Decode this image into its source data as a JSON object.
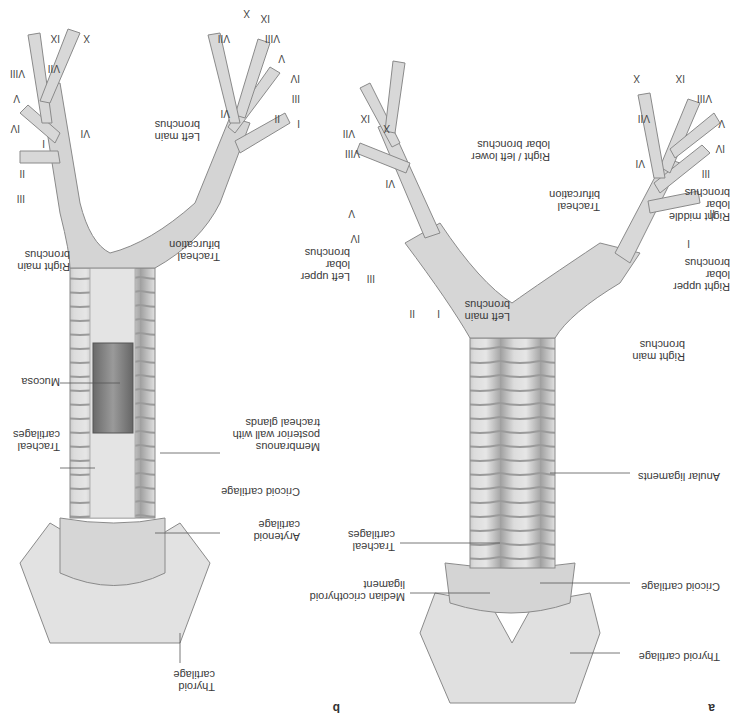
{
  "figure": {
    "orientation": "rotated 180 degrees",
    "panels": [
      {
        "id": "a",
        "letter": "a",
        "view": "anterior",
        "labels": {
          "thyroid_cartilage": "Thyroid cartilage",
          "cricoid_cartilage": "Cricoid cartilage",
          "median_cricothyroid_ligament": "Median cricothyroid ligament",
          "tracheal_cartilages": "Tracheal cartilages",
          "anular_ligaments": "Anular ligaments",
          "right_main_bronchus": "Right main bronchus",
          "left_main_bronchus": "Left main bronchus",
          "tracheal_bifurcation": "Tracheal bifurcation",
          "right_upper_lobar_bronchus": "Right upper lobar bronchus",
          "right_middle_lobar_bronchus": "Right middle lobar bronchus",
          "right_left_lower_lobar_bronchus": "Right / left lower lobar bronchus",
          "left_upper_lobar_bronchus": "Left upper lobar bronchus"
        },
        "segments_right": [
          "I",
          "II",
          "III",
          "IV",
          "V",
          "VI",
          "VII",
          "VIII",
          "IX",
          "X"
        ],
        "segments_left": [
          "I",
          "II",
          "III",
          "IV",
          "V",
          "VI",
          "VII",
          "VIII",
          "IX",
          "X"
        ]
      },
      {
        "id": "b",
        "letter": "b",
        "view": "posterior",
        "labels": {
          "thyroid_cartilage": "Thyroid cartilage",
          "arytenoid_cartilage": "Arytenoid cartilage",
          "cricoid_cartilage": "Cricoid cartilage",
          "membranous_wall": "Membranous posterior wall with tracheal glands",
          "tracheal_cartilages": "Tracheal cartilages",
          "mucosa": "Mucosa",
          "tracheal_bifurcation": "Tracheal bifurcation",
          "right_main_bronchus": "Right main bronchus",
          "left_main_bronchus": "Left main bronchus"
        },
        "segments_right": [
          "I",
          "II",
          "III",
          "IV",
          "V",
          "VI",
          "VII",
          "VIII",
          "IX",
          "X"
        ],
        "segments_left": [
          "I",
          "II",
          "III",
          "IV",
          "V",
          "VI",
          "VII",
          "VIII",
          "IX",
          "X"
        ]
      }
    ],
    "colors": {
      "tissue": "#d9d9d9",
      "tissue_shade": "#b3b3b3",
      "mucosa": "#8a8a8a",
      "line": "#555555",
      "background": "#ffffff"
    }
  }
}
